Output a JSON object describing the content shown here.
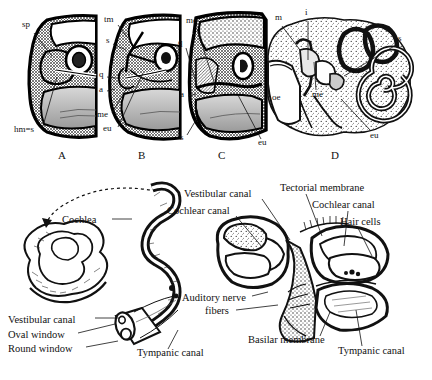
{
  "figure": {
    "background_color": "#ffffff",
    "ink_color": "#111111"
  },
  "top_row": {
    "panels": [
      {
        "letter": "A",
        "letter_x": 62,
        "letter_y": 158,
        "labels": [
          {
            "text": "sp",
            "x": 22,
            "y": 26,
            "lx1": 34,
            "ly1": 33,
            "lx2": 52,
            "ly2": 56
          },
          {
            "text": "hm=s",
            "x": 14,
            "y": 131,
            "lx1": 43,
            "ly1": 126,
            "lx2": 57,
            "ly2": 77
          }
        ]
      },
      {
        "letter": "B",
        "letter_x": 142,
        "letter_y": 158,
        "labels": [
          {
            "text": "tm",
            "x": 104,
            "y": 21,
            "lx1": 118,
            "ly1": 25,
            "lx2": 128,
            "ly2": 38
          },
          {
            "text": "s",
            "x": 106,
            "y": 42,
            "lx1": 113,
            "ly1": 44,
            "lx2": 126,
            "ly2": 50
          },
          {
            "text": "q",
            "x": 99,
            "y": 76,
            "lx1": 107,
            "ly1": 77,
            "lx2": 116,
            "ly2": 78
          },
          {
            "text": "a",
            "x": 99,
            "y": 91,
            "lx1": 107,
            "ly1": 91,
            "lx2": 115,
            "ly2": 89
          },
          {
            "text": "me",
            "x": 97,
            "y": 116,
            "lx1": 112,
            "ly1": 113,
            "lx2": 128,
            "ly2": 86
          },
          {
            "text": "eu",
            "x": 103,
            "y": 130,
            "lx1": 118,
            "ly1": 127,
            "lx2": 143,
            "ly2": 73
          }
        ]
      },
      {
        "letter": "C",
        "letter_x": 222,
        "letter_y": 158,
        "labels": [
          {
            "text": "me",
            "x": 186,
            "y": 22,
            "lx1": 197,
            "ly1": 29,
            "lx2": 216,
            "ly2": 88
          },
          {
            "text": "q",
            "x": 178,
            "y": 44,
            "lx1": 186,
            "ly1": 48,
            "lx2": 197,
            "ly2": 86
          },
          {
            "text": "a",
            "x": 180,
            "y": 96,
            "lx1": 188,
            "ly1": 96,
            "lx2": 196,
            "ly2": 94
          },
          {
            "text": "s",
            "x": 180,
            "y": 139,
            "lx1": 187,
            "ly1": 135,
            "lx2": 196,
            "ly2": 120
          },
          {
            "text": "eu",
            "x": 258,
            "y": 144,
            "lx1": 261,
            "ly1": 139,
            "lx2": 238,
            "ly2": 95
          }
        ]
      },
      {
        "letter": "D",
        "letter_x": 335,
        "letter_y": 158,
        "labels": [
          {
            "text": "m",
            "x": 275,
            "y": 19,
            "lx1": 282,
            "ly1": 26,
            "lx2": 300,
            "ly2": 50
          },
          {
            "text": "i",
            "x": 305,
            "y": 14,
            "lx1": 308,
            "ly1": 21,
            "lx2": 308,
            "ly2": 60
          },
          {
            "text": "s",
            "x": 398,
            "y": 40,
            "lx1": 396,
            "ly1": 45,
            "lx2": 344,
            "ly2": 76
          },
          {
            "text": "oe",
            "x": 272,
            "y": 99,
            "lx1": 0,
            "ly1": 0,
            "lx2": 0,
            "ly2": 0
          },
          {
            "text": "me",
            "x": 312,
            "y": 96,
            "lx1": 316,
            "ly1": 90,
            "lx2": 314,
            "ly2": 62
          },
          {
            "text": "eu",
            "x": 370,
            "y": 137,
            "lx1": 371,
            "ly1": 131,
            "lx2": 341,
            "ly2": 99
          }
        ]
      }
    ]
  },
  "bottom_diagram": {
    "labels": [
      {
        "name": "cochlea",
        "text": "Cochlea",
        "x": 62,
        "y": 222,
        "anchor": "start",
        "lx1": 112,
        "ly1": 219,
        "lx2": 132,
        "ly2": 219
      },
      {
        "name": "vestibular-canal-left",
        "text": "Vestibular canal",
        "x": 8,
        "y": 322,
        "anchor": "start",
        "lx1": 95,
        "ly1": 318,
        "lx2": 120,
        "ly2": 318
      },
      {
        "name": "oval-window",
        "text": "Oval window",
        "x": 8,
        "y": 337,
        "anchor": "start",
        "lx1": 78,
        "ly1": 333,
        "lx2": 115,
        "ly2": 324
      },
      {
        "name": "round-window",
        "text": "Round window",
        "x": 8,
        "y": 351,
        "anchor": "start",
        "lx1": 86,
        "ly1": 347,
        "lx2": 118,
        "ly2": 341
      },
      {
        "name": "tympanic-canal-left",
        "text": "Tympanic canal",
        "x": 137,
        "y": 355,
        "anchor": "start",
        "lx1": 168,
        "ly1": 349,
        "lx2": 178,
        "ly2": 330
      },
      {
        "name": "vestibular-canal-mid",
        "text": "Vestibular canal",
        "x": 184,
        "y": 196,
        "anchor": "start",
        "lx1": 262,
        "ly1": 199,
        "lx2": 290,
        "ly2": 240
      },
      {
        "name": "cochlear-canal-mid",
        "text": "Cochlear canal",
        "x": 167,
        "y": 213,
        "anchor": "start",
        "lx1": 236,
        "ly1": 216,
        "lx2": 262,
        "ly2": 247
      },
      {
        "name": "tectorial-membrane",
        "text": "Tectorial membrane",
        "x": 280,
        "y": 190,
        "anchor": "start",
        "lx1": 306,
        "ly1": 194,
        "lx2": 322,
        "ly2": 236
      },
      {
        "name": "cochlear-canal-right",
        "text": "Cochlear canal",
        "x": 312,
        "y": 207,
        "anchor": "start",
        "lx1": 348,
        "ly1": 211,
        "lx2": 344,
        "ly2": 246
      },
      {
        "name": "hair-cells",
        "text": "Hair cells",
        "x": 340,
        "y": 224,
        "anchor": "start",
        "lx1": 358,
        "ly1": 228,
        "lx2": 372,
        "ly2": 256
      },
      {
        "name": "auditory-nerve-line1",
        "text": "Auditory nerve",
        "x": 182,
        "y": 300,
        "anchor": "start",
        "lx1": 252,
        "ly1": 296,
        "lx2": 268,
        "ly2": 292
      },
      {
        "name": "auditory-nerve-line2",
        "text": "fibers",
        "x": 205,
        "y": 313,
        "anchor": "start",
        "lx1": 236,
        "ly1": 310,
        "lx2": 278,
        "ly2": 305
      },
      {
        "name": "basilar-membrane",
        "text": "Basilar membrane",
        "x": 248,
        "y": 342,
        "anchor": "start",
        "lx1": 320,
        "ly1": 336,
        "lx2": 330,
        "ly2": 312
      },
      {
        "name": "tympanic-canal-right",
        "text": "Tympanic canal",
        "x": 338,
        "y": 353,
        "anchor": "start",
        "lx1": 362,
        "ly1": 346,
        "lx2": 356,
        "ly2": 310
      }
    ]
  }
}
